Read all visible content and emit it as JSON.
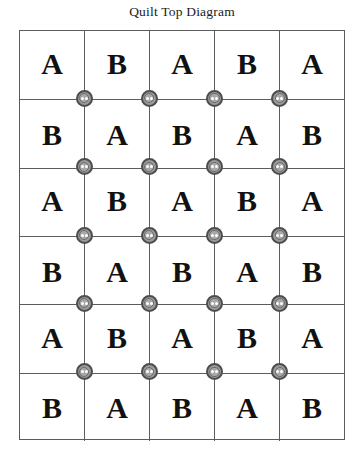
{
  "figure": {
    "title": "Quilt Top Diagram",
    "background_color": "#ffffff",
    "line_color": "#5c5c5c",
    "letter_color": "#111111",
    "button_ring_color": "#4d4d4d",
    "button_fill_color": "#9a9a9a",
    "button_hole_color": "#ffffff"
  },
  "chart_data": {
    "type": "table",
    "title": "Quilt Top Diagram",
    "columns": 5,
    "rows": 6,
    "legend": [
      "A",
      "B"
    ],
    "categories": [
      "col-1",
      "col-2",
      "col-3",
      "col-4",
      "col-5"
    ],
    "grid": [
      [
        "A",
        "B",
        "A",
        "B",
        "A"
      ],
      [
        "B",
        "A",
        "B",
        "A",
        "B"
      ],
      [
        "A",
        "B",
        "A",
        "B",
        "A"
      ],
      [
        "B",
        "A",
        "B",
        "A",
        "B"
      ],
      [
        "A",
        "B",
        "A",
        "B",
        "A"
      ],
      [
        "B",
        "A",
        "B",
        "A",
        "B"
      ]
    ],
    "buttons": {
      "description": "buttons placed at interior grid intersections",
      "rows": 5,
      "columns": 4,
      "count": 20
    },
    "xlabel": "",
    "ylabel": "",
    "grid_on": true,
    "legend_position": "none"
  }
}
